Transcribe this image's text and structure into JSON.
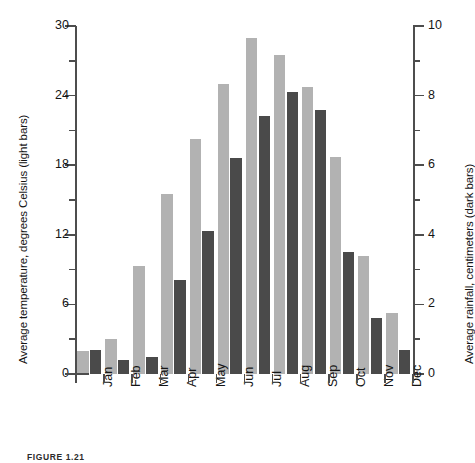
{
  "caption": "FIGURE 1.21",
  "chart_data": {
    "type": "bar",
    "title": "",
    "xlabel": "",
    "ylabel": "Average temperature, degrees Celsius (light bars)",
    "y2label": "Average rainfall, centimeters (dark bars)",
    "categories": [
      "Jan",
      "Feb",
      "Mar",
      "Apr",
      "May",
      "Jun",
      "Jul",
      "Aug",
      "Sep",
      "Oct",
      "Nov",
      "Dec"
    ],
    "series": [
      {
        "name": "Average temperature, degrees Celsius (light bars)",
        "axis": "left",
        "unit": "degrees Celsius",
        "color": "#b2b2b2",
        "values": [
          2.0,
          3.0,
          9.3,
          15.5,
          20.3,
          25.0,
          29.0,
          27.5,
          24.7,
          18.7,
          10.2,
          5.3
        ]
      },
      {
        "name": "Average rainfall, centimeters (dark bars)",
        "axis": "right",
        "unit": "centimeters",
        "color": "#4a4a4a",
        "values": [
          0.7,
          0.4,
          0.5,
          2.7,
          4.1,
          6.2,
          7.4,
          8.1,
          7.6,
          3.5,
          1.6,
          0.7
        ]
      }
    ],
    "ylim": [
      0,
      30
    ],
    "yticks": [
      0,
      6,
      12,
      18,
      24,
      30
    ],
    "yminor_ticks": [
      3,
      9,
      15,
      21,
      27
    ],
    "y2lim": [
      0,
      10
    ],
    "y2ticks": [
      0,
      2,
      4,
      6,
      8,
      10
    ],
    "y2minor_ticks": [
      1,
      3,
      5,
      7,
      9
    ],
    "grid": false,
    "legend": "encoded-in-axis-titles"
  }
}
